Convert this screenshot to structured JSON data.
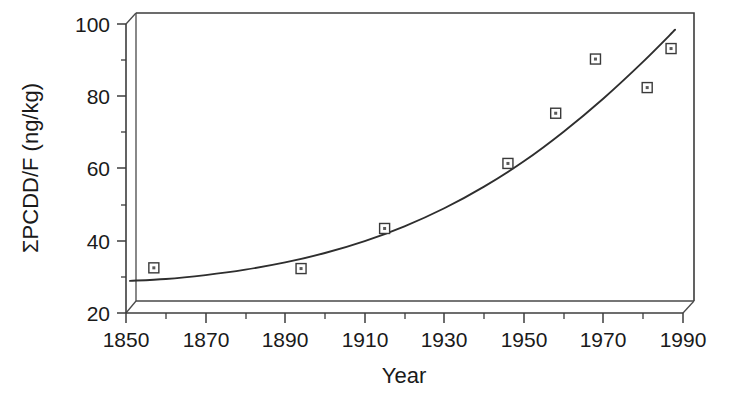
{
  "chart_data": {
    "type": "scatter",
    "title": "",
    "subtitle": "",
    "xlabel": "Year",
    "ylabel": "ΣPCDD/F (ng/kg)",
    "xlim": [
      1850,
      1990
    ],
    "ylim": [
      20,
      100
    ],
    "grid": false,
    "legend": "none",
    "x_ticks": [
      1850,
      1870,
      1890,
      1910,
      1930,
      1950,
      1970,
      1990
    ],
    "x_tick_labels": [
      "1850",
      "1870",
      "1890",
      "1910",
      "1930",
      "1950",
      "1970",
      "1990"
    ],
    "x_minor_ticks": [
      1860,
      1880,
      1900,
      1920,
      1940,
      1960,
      1980
    ],
    "y_ticks": [
      20,
      40,
      60,
      80,
      100
    ],
    "y_tick_labels": [
      "20",
      "40",
      "60",
      "80",
      "100"
    ],
    "y_minor_ticks": [
      30,
      50,
      70,
      90
    ],
    "series": [
      {
        "name": "Measured ΣPCDD/F",
        "kind": "scatter",
        "marker": "open-square-with-dot",
        "x": [
          1857,
          1894,
          1915,
          1946,
          1958,
          1968,
          1981,
          1987
        ],
        "y": [
          32.5,
          32.3,
          43.4,
          61.4,
          75.3,
          90.3,
          82.4,
          93.2
        ]
      },
      {
        "name": "Fitted trend",
        "kind": "line",
        "x": [
          1851,
          1860,
          1870,
          1880,
          1890,
          1900,
          1910,
          1920,
          1930,
          1940,
          1950,
          1960,
          1970,
          1980,
          1988
        ],
        "y": [
          28.9,
          29.4,
          30.5,
          32.0,
          34.0,
          36.6,
          39.9,
          44.0,
          49.0,
          55.0,
          62.0,
          70.2,
          79.4,
          89.6,
          98.4
        ]
      }
    ]
  },
  "axes": {
    "x_axis_name": "Year",
    "y_axis_name": "ΣPCDD/F (ng/kg)"
  }
}
